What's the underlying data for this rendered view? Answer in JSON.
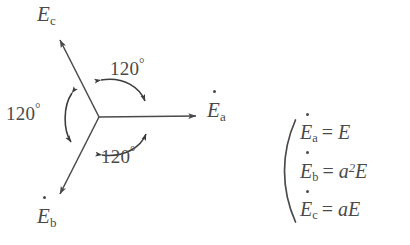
{
  "figure": {
    "type": "phasor-diagram",
    "background_color": "#ffffff",
    "stroke_color": "#4a4a4a",
    "center": {
      "x": 99,
      "y": 117
    },
    "phasors": [
      {
        "name": "E_a",
        "symbol": "E",
        "subscript": "a",
        "dot": true,
        "angle_deg": 0,
        "tip": {
          "x": 199,
          "y": 116
        },
        "label_pos": {
          "x": 207,
          "y": 101
        }
      },
      {
        "name": "E_c",
        "symbol": "E",
        "subscript": "c",
        "dot": true,
        "angle_deg": 120,
        "tip": {
          "x": 57,
          "y": 36
        },
        "label_pos": {
          "x": 36,
          "y": 3
        }
      },
      {
        "name": "E_b",
        "symbol": "E",
        "subscript": "b",
        "dot": true,
        "angle_deg": -120,
        "tip": {
          "x": 57,
          "y": 198
        },
        "label_pos": {
          "x": 36,
          "y": 206
        }
      }
    ],
    "angle_annotations": [
      {
        "name": "angle-top",
        "value": "120",
        "unit": "°",
        "label_pos": {
          "x": 110,
          "y": 57
        }
      },
      {
        "name": "angle-left",
        "value": "120",
        "unit": "°",
        "label_pos": {
          "x": 6,
          "y": 102
        }
      },
      {
        "name": "angle-bottom",
        "value": "120",
        "unit": "°",
        "label_pos": {
          "x": 101,
          "y": 145
        }
      }
    ]
  },
  "equations": {
    "bracket": "(",
    "lines": [
      {
        "lhs_symbol": "E",
        "lhs_sub": "a",
        "dot": true,
        "operator": "=",
        "rhs": "E",
        "rhs_exp": ""
      },
      {
        "lhs_symbol": "E",
        "lhs_sub": "b",
        "dot": true,
        "operator": "=",
        "rhs": "a",
        "rhs_exp": "2",
        "rhs_tail": "E"
      },
      {
        "lhs_symbol": "E",
        "lhs_sub": "c",
        "dot": true,
        "operator": "=",
        "rhs": "a",
        "rhs_exp": "",
        "rhs_tail": "E"
      }
    ]
  }
}
